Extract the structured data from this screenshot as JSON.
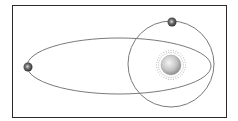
{
  "diagram": {
    "type": "orbital-diagram",
    "frame": {
      "x": 12,
      "y": 5,
      "width": 215,
      "height": 113,
      "stroke": "#2a2a2a"
    },
    "star": {
      "cx": 171,
      "cy": 65,
      "r": 10,
      "rays_r": 15,
      "fill_light": "#f2f2f2",
      "fill_dark": "#8a8a8a"
    },
    "orbits": [
      {
        "name": "elliptical-orbit",
        "cx": 119,
        "cy": 66,
        "rx": 92,
        "ry": 28,
        "stroke": "#7a7a7a"
      },
      {
        "name": "circular-orbit",
        "cx": 171,
        "cy": 64,
        "r": 43,
        "stroke": "#7a7a7a"
      }
    ],
    "planets": [
      {
        "name": "planet-elliptical",
        "cx": 28,
        "cy": 67,
        "r": 4.5
      },
      {
        "name": "planet-circular",
        "cx": 172,
        "cy": 22,
        "r": 4.5
      }
    ]
  }
}
